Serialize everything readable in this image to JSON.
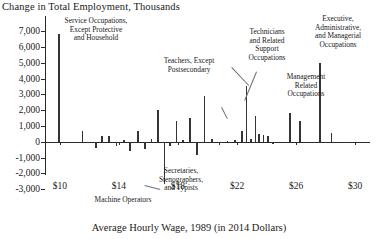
{
  "chart_data": {
    "type": "bar",
    "title": "Change in Total Employment, Thousands",
    "xlabel": "Average Hourly Wage, 1989 (in 2014 Dollars)",
    "ylabel": "Change in Total Employment, Thousands",
    "xlim": [
      9.0,
      31.0
    ],
    "ylim": [
      -3000,
      7000
    ],
    "grid": false,
    "legend": "none",
    "xticks": [
      "$10",
      "$14",
      "$18",
      "$22",
      "$26",
      "$30"
    ],
    "xtick_values": [
      10,
      14,
      18,
      22,
      26,
      30
    ],
    "yticks": [
      "7,000",
      "6,000",
      "5,000",
      "4,000",
      "3,000",
      "2,000",
      "1,000",
      "0",
      "-1,000",
      "-2,000",
      "-3,000"
    ],
    "ytick_values": [
      7000,
      6000,
      5000,
      4000,
      3000,
      2000,
      1000,
      0,
      -1000,
      -2000,
      -3000
    ],
    "x": [
      9.95,
      11.55,
      12.45,
      12.85,
      13.35,
      13.85,
      14.35,
      14.75,
      15.3,
      15.75,
      16.2,
      16.65,
      17.1,
      17.45,
      17.9,
      18.35,
      18.8,
      19.3,
      19.8,
      20.3,
      20.8,
      21.35,
      21.85,
      22.35,
      22.65,
      22.95,
      23.25,
      23.5,
      23.8,
      24.1,
      24.45,
      25.6,
      26.25,
      27.6,
      28.4,
      29.3
    ],
    "values": [
      6800,
      700,
      -400,
      350,
      380,
      -250,
      80,
      -600,
      650,
      -450,
      150,
      2000,
      -2700,
      -300,
      1300,
      120,
      1500,
      -850,
      2900,
      200,
      -180,
      60,
      120,
      700,
      3500,
      180,
      1600,
      500,
      450,
      380,
      -120,
      1800,
      1300,
      5000,
      520,
      -60
    ],
    "annotations": [
      {
        "id": "service",
        "text": "Service Occupations,\nExcept Protective\nand Household",
        "target_x": 9.95,
        "target_y": 6800
      },
      {
        "id": "teachers",
        "text": "Teachers, Except\nPostsecondary",
        "target_x": 22.65,
        "target_y": 3500
      },
      {
        "id": "technicians",
        "text": "Technicians\nand Related\nSupport\nOccupations",
        "target_x": 23.25,
        "target_y": 1600
      },
      {
        "id": "management",
        "text": "Management\nRelated\nOccupations",
        "target_x": 25.6,
        "target_y": 1800
      },
      {
        "id": "executive",
        "text": "Executive,\nAdministrative,\nand Managerial\nOccupations",
        "target_x": 27.6,
        "target_y": 5000
      },
      {
        "id": "secretaries",
        "text": "Secretaries,\nStenographers,\nand Typists",
        "target_x": 17.1,
        "target_y": -2700
      },
      {
        "id": "machine",
        "text": "Machine Operators",
        "target_x": 14.75,
        "target_y": -600
      }
    ]
  },
  "labels": {
    "title": "Change in Total Employment, Thousands",
    "xaxis": "Average Hourly Wage, 1989 (in 2014 Dollars)",
    "anno_service": "Service Occupations,\nExcept Protective\nand Household",
    "anno_teachers": "Teachers, Except\nPostsecondary",
    "anno_technicians": "Technicians\nand Related\nSupport\nOccupations",
    "anno_management": "Management\nRelated\nOccupations",
    "anno_executive": "Executive,\nAdministrative,\nand Managerial\nOccupations",
    "anno_secretaries": "Secretaries,\nStenographers,\nand Typists",
    "anno_machine": "Machine Operators"
  },
  "colors": {
    "bar": "#343434",
    "axis": "#2b2b2b",
    "leader": "#6f6f6f",
    "background": "#ffffff"
  }
}
